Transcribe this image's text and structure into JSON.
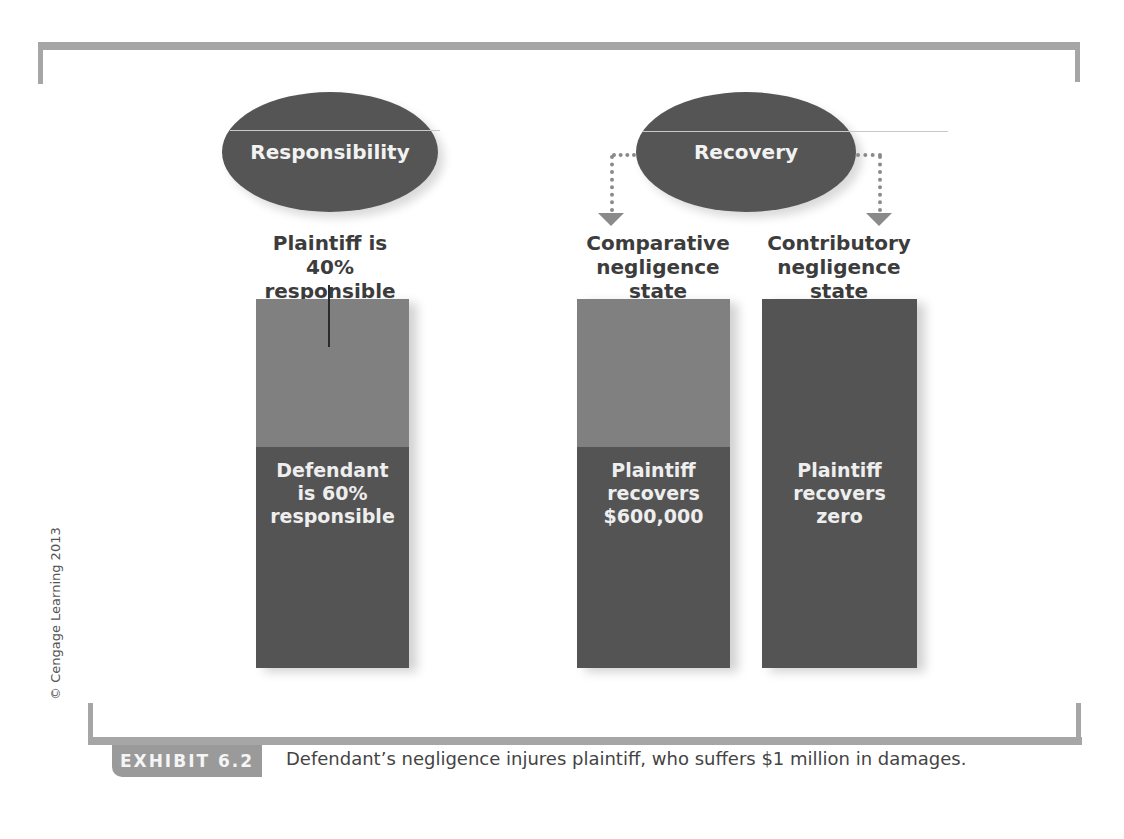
{
  "diagram": {
    "headers": {
      "responsibility": "Responsibility",
      "recovery": "Recovery"
    },
    "columns": [
      {
        "id": "responsibility",
        "label_lines": [
          "Plaintiff is",
          "40% responsible"
        ],
        "segments": [
          {
            "share": 40,
            "color": "#808080",
            "text_lines": []
          },
          {
            "share": 60,
            "color": "#545454",
            "text_lines": [
              "Defendant",
              "is 60%",
              "responsible"
            ]
          }
        ]
      },
      {
        "id": "comparative",
        "label_lines": [
          "Comparative",
          "negligence state"
        ],
        "segments": [
          {
            "share": 40,
            "color": "#808080",
            "text_lines": []
          },
          {
            "share": 60,
            "color": "#545454",
            "text_lines": [
              "Plaintiff",
              "recovers",
              "$600,000"
            ]
          }
        ]
      },
      {
        "id": "contributory",
        "label_lines": [
          "Contributory",
          "negligence state"
        ],
        "segments": [
          {
            "share": 100,
            "color": "#545454",
            "text_lines": [
              "Plaintiff",
              "recovers",
              "zero"
            ]
          }
        ]
      }
    ],
    "colors": {
      "frame": "#a6a6a6",
      "ellipse": "#555555",
      "light_segment": "#808080",
      "dark_segment": "#545454",
      "arrow": "#8a8a8a"
    }
  },
  "copyright": "© Cengage Learning 2013",
  "exhibit": {
    "tab_label": "EXHIBIT 6.2",
    "caption": "Defendant’s negligence injures plaintiff, who suffers $1 million in damages."
  }
}
